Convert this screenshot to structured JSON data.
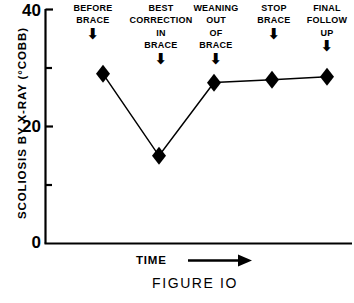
{
  "chart_data": {
    "type": "line",
    "title": "FIGURE IO",
    "xlabel": "TIME",
    "ylabel": "SCOLIOSIS BY X-RAY (°COBB)",
    "ylim": [
      0,
      40
    ],
    "yticks": [
      0,
      10,
      20,
      30,
      40
    ],
    "ytick_labels": [
      "0",
      "",
      "20",
      "",
      "40"
    ],
    "y_major_labels": [
      "0",
      "20",
      "40"
    ],
    "grid": false,
    "legend": false,
    "marker": "filled-diamond",
    "categories": [
      "BEFORE BRACE",
      "BEST CORRECTION IN BRACE",
      "WEANING OUT OF BRACE",
      "STOP BRACE",
      "FINAL FOLLOW UP"
    ],
    "values": [
      29,
      15,
      27.5,
      28,
      28.5
    ],
    "x_positions": [
      103,
      159,
      214,
      272,
      327
    ],
    "annotations": [
      {
        "lines": "BEFORE\nBRACE",
        "arrow": "⬇",
        "value": 29
      },
      {
        "lines": "BEST\nCORRECTION\nIN\nBRACE",
        "arrow": "⬇",
        "value": 15
      },
      {
        "lines": "WEANING\nOUT\nOF\nBRACE",
        "arrow": "⬇",
        "value": 27.5
      },
      {
        "lines": "STOP\nBRACE",
        "arrow": "⬇",
        "value": 28
      },
      {
        "lines": "FINAL\nFOLLOW\nUP",
        "arrow": "⬇",
        "value": 28.5
      }
    ]
  },
  "axis": {
    "y_title": "SCOLIOSIS  BY  X-RAY   (°COBB)",
    "tick_top": "40",
    "tick_mid": "20",
    "tick_bottom": "0",
    "x_title": "TIME"
  },
  "caption": {
    "text": "FIGURE   IO"
  },
  "colors": {
    "ink": "#000000",
    "paper": "#ffffff"
  }
}
